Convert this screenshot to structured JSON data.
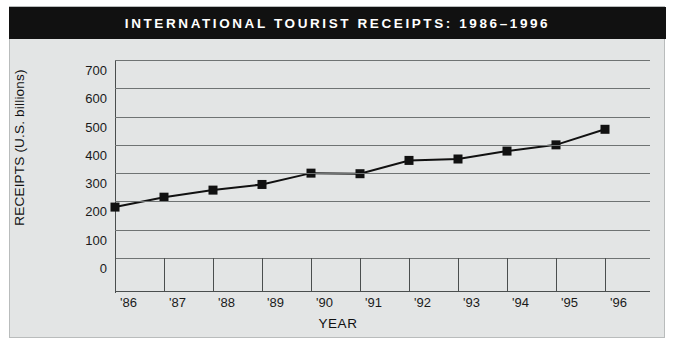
{
  "figure": {
    "title": "INTERNATIONAL TOURIST RECEIPTS: 1986–1996",
    "banner_color": "#111111",
    "banner_text_color": "#ffffff",
    "background_color": "#e3e5e5",
    "border_color": "#b9bcbc"
  },
  "chart_data": {
    "type": "line",
    "title": "INTERNATIONAL TOURIST RECEIPTS: 1986–1996",
    "xlabel": "YEAR",
    "ylabel": "RECEIPTS (U.S. billions)",
    "categories": [
      "'86",
      "'87",
      "'88",
      "'89",
      "'90",
      "'91",
      "'92",
      "'93",
      "'94",
      "'95",
      "'96"
    ],
    "values": [
      180,
      215,
      240,
      260,
      300,
      298,
      345,
      350,
      378,
      400,
      455
    ],
    "ylim": [
      0,
      700
    ],
    "ytick_values": [
      0,
      100,
      200,
      300,
      400,
      500,
      600,
      700
    ],
    "ytick_labels": [
      "0",
      "100",
      "200",
      "300",
      "400",
      "500",
      "600",
      "700"
    ],
    "grid": "horizontal",
    "legend": "none",
    "marker": "square",
    "line_color": "#111111",
    "marker_color": "#111111",
    "gridline_color": "#6f7373"
  }
}
